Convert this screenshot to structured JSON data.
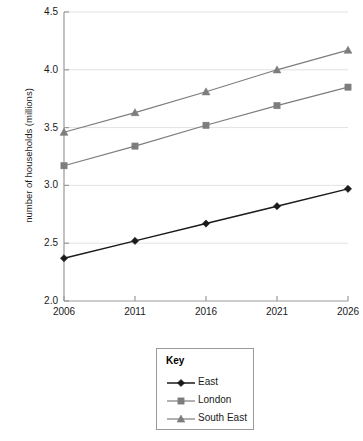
{
  "chart_data": {
    "type": "line",
    "title": "",
    "xlabel": "",
    "ylabel": "number of households (millions)",
    "x": [
      2006,
      2011,
      2016,
      2021,
      2026
    ],
    "categories": [
      "2006",
      "2011",
      "2016",
      "2021",
      "2026"
    ],
    "series": [
      {
        "name": "East",
        "marker": "diamond",
        "color": "#1a1a1a",
        "values": [
          2.37,
          2.52,
          2.67,
          2.82,
          2.97
        ]
      },
      {
        "name": "London",
        "marker": "square",
        "color": "#7d7d7d",
        "values": [
          3.17,
          3.34,
          3.52,
          3.69,
          3.85
        ]
      },
      {
        "name": "South East",
        "marker": "triangle",
        "color": "#7d7d7d",
        "values": [
          3.46,
          3.63,
          3.81,
          4.0,
          4.17
        ]
      }
    ],
    "ylim": [
      2.0,
      4.5
    ],
    "ytick_values": [
      2.0,
      2.5,
      3.0,
      3.5,
      4.0,
      4.5
    ],
    "ytick_labels": [
      "2.0",
      "2.5",
      "3.0",
      "3.5",
      "4.0",
      "4.5"
    ],
    "grid": "horizontal",
    "legend_position": "bottom-center"
  },
  "legend": {
    "title": "Key",
    "entries": [
      {
        "label": "East"
      },
      {
        "label": "London"
      },
      {
        "label": "South East"
      }
    ]
  },
  "colors": {
    "east": "#1a1a1a",
    "london": "#7d7d7d",
    "south_east": "#7d7d7d",
    "axis": "#9a9a9a",
    "gridline": "#e2e2e2",
    "legend_border": "#9a9a9a"
  }
}
